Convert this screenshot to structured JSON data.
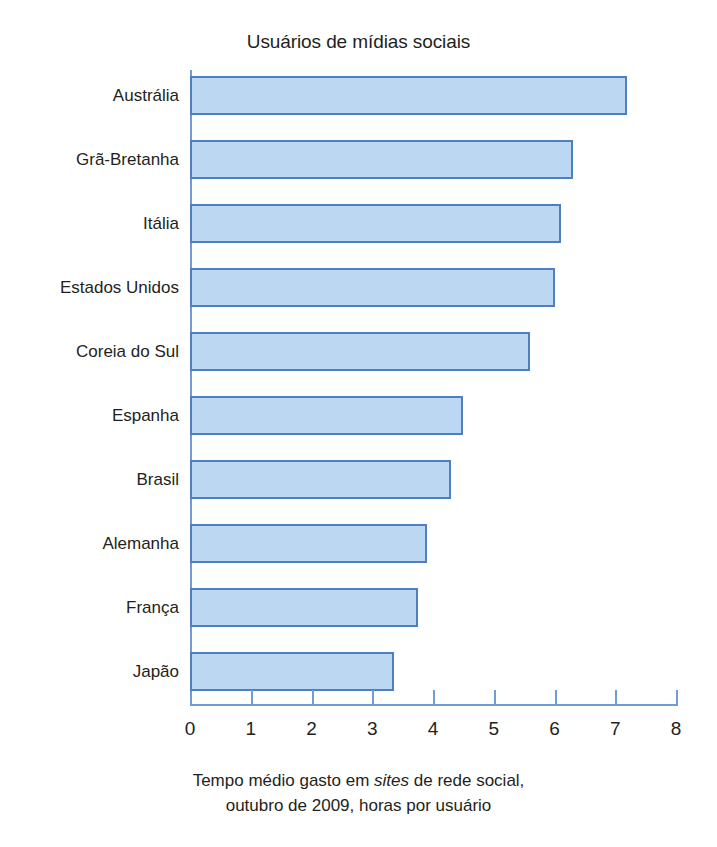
{
  "chart_data": {
    "type": "bar",
    "orientation": "horizontal",
    "title": "Usuários de mídias sociais",
    "xlabel_line1_pre": "Tempo médio gasto em ",
    "xlabel_line1_italic": "sites",
    "xlabel_line1_post": " de rede social,",
    "xlabel_line2": "outubro de 2009, horas por usuário",
    "ylabel": "",
    "categories": [
      "Austrália",
      "Grã-Bretanha",
      "Itália",
      "Estados Unidos",
      "Coreia do Sul",
      "Espanha",
      "Brasil",
      "Alemanha",
      "França",
      "Japão"
    ],
    "values": [
      7.2,
      6.3,
      6.1,
      6.0,
      5.6,
      4.5,
      4.3,
      3.9,
      3.75,
      3.35
    ],
    "xlim": [
      0,
      8
    ],
    "xticks": [
      0,
      1,
      2,
      3,
      4,
      5,
      6,
      7,
      8
    ],
    "xtick_labels": [
      "0",
      "1",
      "2",
      "3",
      "4",
      "5",
      "6",
      "7",
      "8"
    ],
    "grid": false,
    "legend": null,
    "bar_fill_color": "#bcd7f2",
    "bar_border_color": "#4f7fbf",
    "axis_color": "#6f9dd4",
    "text_color": "#231f20",
    "background_color": "#ffffff"
  }
}
